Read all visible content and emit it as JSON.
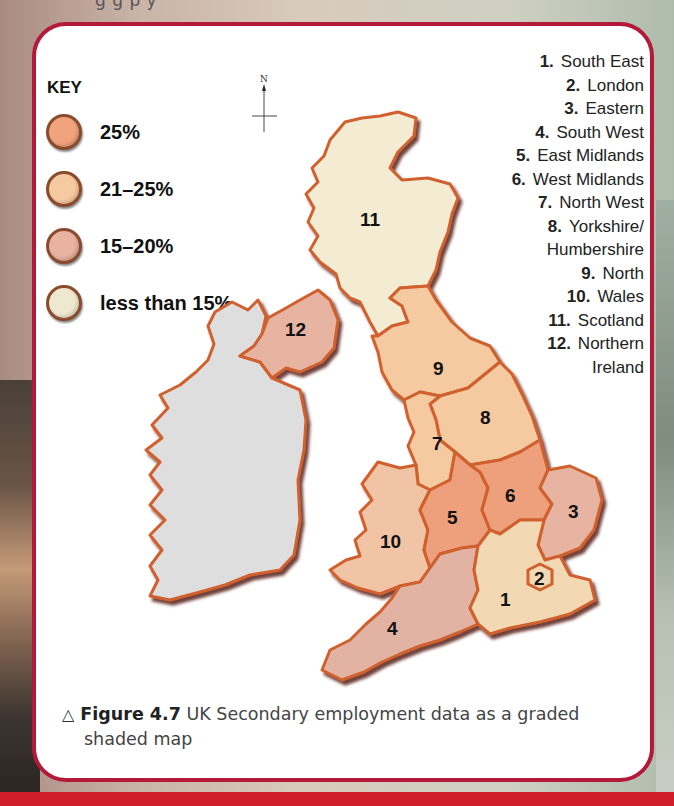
{
  "page": {
    "top_cropped_text": "g              g       p  y"
  },
  "key": {
    "title": "KEY",
    "items": [
      {
        "label": "25%",
        "color": "#f1a37e"
      },
      {
        "label": "21–25%",
        "color": "#f6caa0"
      },
      {
        "label": "15–20%",
        "color": "#e9b3a1"
      },
      {
        "label": "less than 15%",
        "color": "#eee8cf"
      }
    ]
  },
  "compass": {
    "north_label": "N"
  },
  "legend": {
    "items": [
      {
        "num": "1.",
        "name": "South East"
      },
      {
        "num": "2.",
        "name": "London"
      },
      {
        "num": "3.",
        "name": "Eastern"
      },
      {
        "num": "4.",
        "name": "South West"
      },
      {
        "num": "5.",
        "name": "East Midlands"
      },
      {
        "num": "6.",
        "name": "West Midlands"
      },
      {
        "num": "7.",
        "name": "North West"
      },
      {
        "num": "8.",
        "name": "Yorkshire/"
      },
      {
        "num": "",
        "name": "Humbershire"
      },
      {
        "num": "9.",
        "name": "North"
      },
      {
        "num": "10.",
        "name": "Wales"
      },
      {
        "num": "11.",
        "name": "Scotland"
      },
      {
        "num": "12.",
        "name": "Northern"
      },
      {
        "num": "",
        "name": "Ireland"
      }
    ]
  },
  "map": {
    "region_labels": [
      "1",
      "2",
      "3",
      "4",
      "5",
      "6",
      "7",
      "8",
      "9",
      "10",
      "11",
      "12"
    ],
    "colors": {
      "band_25": "#f0a27c",
      "band_21_25": "#f5caa0",
      "band_15_20": "#e7b4a3",
      "band_lt15": "#f2ecd2",
      "ireland": "#dcdcdc",
      "outline": "#c95a2c",
      "shadow": "#6b2a18"
    },
    "regions": [
      {
        "id": 1,
        "name": "South East",
        "band": "21-25%"
      },
      {
        "id": 2,
        "name": "London",
        "band": "21-25%"
      },
      {
        "id": 3,
        "name": "Eastern",
        "band": "15-20%"
      },
      {
        "id": 4,
        "name": "South West",
        "band": "15-20%"
      },
      {
        "id": 5,
        "name": "East Midlands",
        "band": "25%"
      },
      {
        "id": 6,
        "name": "West Midlands",
        "band": "25%"
      },
      {
        "id": 7,
        "name": "North West",
        "band": "21-25%"
      },
      {
        "id": 8,
        "name": "Yorkshire/Humbershire",
        "band": "21-25%"
      },
      {
        "id": 9,
        "name": "North",
        "band": "21-25%"
      },
      {
        "id": 10,
        "name": "Wales",
        "band": "21-25%"
      },
      {
        "id": 11,
        "name": "Scotland",
        "band": "less than 15%"
      },
      {
        "id": 12,
        "name": "Northern Ireland",
        "band": "15-20%"
      }
    ]
  },
  "caption": {
    "triangle": "△",
    "figure_label": "Figure 4.7",
    "text_line1": "UK Secondary employment data as a graded",
    "text_line2": "shaded map"
  }
}
